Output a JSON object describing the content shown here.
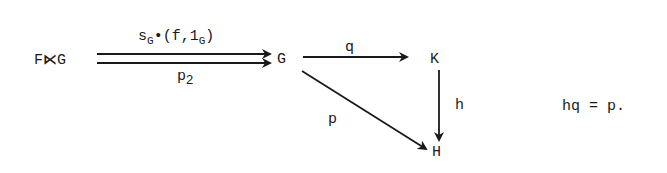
{
  "diagram": {
    "nodes": {
      "product": {
        "main": "F",
        "op": "⋉",
        "rest": "G"
      },
      "G": "G",
      "K": "K",
      "H": "H"
    },
    "arrows": {
      "top_parallel": {
        "s": "s",
        "s_sub": "G",
        "dot": "•",
        "paren_open": "(f,1",
        "one_sub": "G",
        "paren_close": ")"
      },
      "bottom_parallel": {
        "p": "p",
        "p_sub": "2"
      },
      "G_to_K": "q",
      "K_to_H": "h",
      "G_to_H": "p"
    },
    "equation": "hq = p."
  }
}
